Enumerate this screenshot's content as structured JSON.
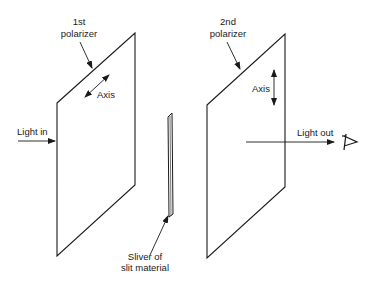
{
  "diagram": {
    "labels": {
      "first_polarizer_line1": "1st",
      "first_polarizer_line2": "polarizer",
      "first_axis": "Axis",
      "second_polarizer_line1": "2nd",
      "second_polarizer_line2": "polarizer",
      "second_axis": "Axis",
      "light_in": "Light in",
      "light_out": "Light out",
      "sliver_line1": "Sliver of",
      "sliver_line2": "slit material"
    },
    "icons": {
      "eye": "eye-icon"
    },
    "colors": {
      "stroke": "#1a1a1a",
      "background": "#ffffff"
    }
  }
}
